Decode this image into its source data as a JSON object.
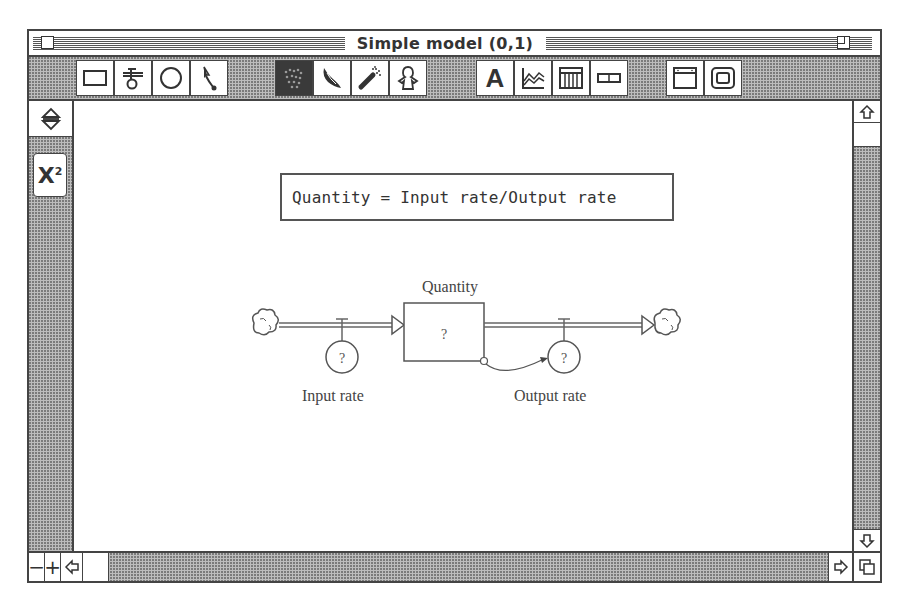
{
  "window": {
    "title": "Simple model (0,1)",
    "close_box": "close-box",
    "zoom_box": "zoom-box"
  },
  "toolbar": {
    "groups": [
      {
        "name": "building-blocks",
        "tools": [
          {
            "id": "stock",
            "icon": "rectangle-stock-icon",
            "selected": false
          },
          {
            "id": "flow",
            "icon": "flow-valve-icon",
            "selected": false
          },
          {
            "id": "converter",
            "icon": "circle-converter-icon",
            "selected": false
          },
          {
            "id": "connector",
            "icon": "connector-arrow-icon",
            "selected": false
          }
        ]
      },
      {
        "name": "object-tools",
        "tools": [
          {
            "id": "hand",
            "icon": "hand-grab-icon",
            "selected": true
          },
          {
            "id": "paintbrush",
            "icon": "paintbrush-icon",
            "selected": false
          },
          {
            "id": "dynamite",
            "icon": "dynamite-icon",
            "selected": false
          },
          {
            "id": "ghost",
            "icon": "ghost-icon",
            "selected": false
          }
        ]
      },
      {
        "name": "output-tools",
        "tools": [
          {
            "id": "text",
            "icon": "text-a-icon",
            "label": "A",
            "selected": false
          },
          {
            "id": "graph",
            "icon": "graph-icon",
            "selected": false
          },
          {
            "id": "table",
            "icon": "table-icon",
            "selected": false
          },
          {
            "id": "numeric-display",
            "icon": "numeric-display-icon",
            "selected": false
          }
        ]
      },
      {
        "name": "input-tools",
        "tools": [
          {
            "id": "button",
            "icon": "button-window-icon",
            "selected": false
          },
          {
            "id": "sector",
            "icon": "sector-frame-icon",
            "selected": false
          }
        ]
      }
    ]
  },
  "palette": {
    "toggle_icon": "up-down-arrows-icon",
    "equation_button": {
      "label": "X",
      "superscript": "2",
      "icon": "x-squared-icon"
    }
  },
  "canvas": {
    "equation_text": "Quantity = Input rate/Output rate",
    "stock": {
      "name": "Quantity",
      "value": "?"
    },
    "inflow": {
      "name": "Input rate",
      "value": "?"
    },
    "outflow": {
      "name": "Output rate",
      "value": "?"
    },
    "source_cloud": "cloud-icon",
    "sink_cloud": "cloud-icon"
  },
  "scrollbars": {
    "vertical": {
      "up": "up-arrow-icon",
      "down": "down-arrow-icon",
      "thumb_position": 0
    },
    "horizontal": {
      "zoom_out_label": "−",
      "zoom_in_label": "+",
      "left": "left-arrow-icon",
      "right": "right-arrow-icon",
      "thumb_position": 0
    },
    "grow_box": "resize-icon"
  }
}
